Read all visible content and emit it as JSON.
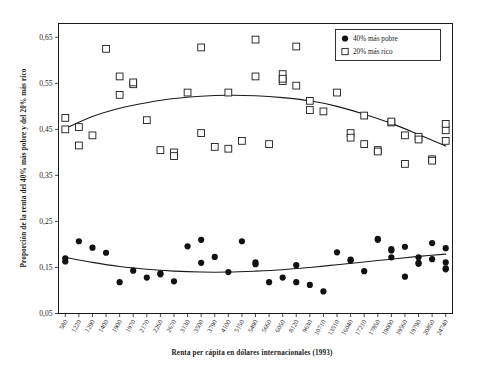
{
  "chart_data": {
    "type": "scatter",
    "title": "",
    "xlabel": "Renta per cápita en dólares internacionales (1993)",
    "ylabel": "Proporción de la renta del 40% más pobre y del 20% más rico",
    "grid": false,
    "legend_position": "top-right",
    "ylim": [
      0.05,
      0.68
    ],
    "yticks": [
      "0,05",
      "0,15",
      "0,25",
      "0,35",
      "0,45",
      "0,55",
      "0,65"
    ],
    "ytick_values": [
      0.05,
      0.15,
      0.25,
      0.35,
      0.45,
      0.55,
      0.65
    ],
    "xtick_labels": [
      "580",
      "1220",
      "1290",
      "1400",
      "1900",
      "1970",
      "2170",
      "2260",
      "2670",
      "3130",
      "3500",
      "3790",
      "4100",
      "5150",
      "5490",
      "5660",
      "6050",
      "8120",
      "9630",
      "10710",
      "13510",
      "16040",
      "17210",
      "17850",
      "19000",
      "19560",
      "19790",
      "20850",
      "24740"
    ],
    "legend": [
      {
        "label": "40% más pobre",
        "marker": "filled-circle",
        "color": "#111111"
      },
      {
        "label": "20% más rico",
        "marker": "open-square",
        "color": "#ffffff"
      }
    ],
    "series": [
      {
        "name": "20% más rico",
        "marker": "open-square",
        "points": [
          [
            0,
            0.45
          ],
          [
            0,
            0.475
          ],
          [
            1,
            0.455
          ],
          [
            1,
            0.415
          ],
          [
            2,
            0.437
          ],
          [
            3,
            0.625
          ],
          [
            4,
            0.525
          ],
          [
            4,
            0.565
          ],
          [
            5,
            0.548
          ],
          [
            5,
            0.552
          ],
          [
            6,
            0.47
          ],
          [
            7,
            0.405
          ],
          [
            8,
            0.4
          ],
          [
            8,
            0.392
          ],
          [
            9,
            0.53
          ],
          [
            10,
            0.442
          ],
          [
            10,
            0.628
          ],
          [
            11,
            0.412
          ],
          [
            12,
            0.408
          ],
          [
            12,
            0.53
          ],
          [
            13,
            0.425
          ],
          [
            14,
            0.565
          ],
          [
            14,
            0.645
          ],
          [
            15,
            0.418
          ],
          [
            16,
            0.555
          ],
          [
            16,
            0.57
          ],
          [
            16,
            0.56
          ],
          [
            17,
            0.545
          ],
          [
            17,
            0.63
          ],
          [
            18,
            0.492
          ],
          [
            18,
            0.512
          ],
          [
            19,
            0.489
          ],
          [
            20,
            0.53
          ],
          [
            21,
            0.442
          ],
          [
            21,
            0.432
          ],
          [
            22,
            0.48
          ],
          [
            22,
            0.418
          ],
          [
            23,
            0.405
          ],
          [
            23,
            0.402
          ],
          [
            24,
            0.465
          ],
          [
            24,
            0.467
          ],
          [
            25,
            0.437
          ],
          [
            25,
            0.375
          ],
          [
            26,
            0.434
          ],
          [
            26,
            0.428
          ],
          [
            27,
            0.385
          ],
          [
            27,
            0.382
          ],
          [
            28,
            0.448
          ],
          [
            28,
            0.425
          ],
          [
            28,
            0.462
          ]
        ]
      },
      {
        "name": "40% más pobre",
        "marker": "filled-circle",
        "points": [
          [
            0,
            0.17
          ],
          [
            0,
            0.163
          ],
          [
            1,
            0.207
          ],
          [
            2,
            0.193
          ],
          [
            3,
            0.182
          ],
          [
            4,
            0.118
          ],
          [
            5,
            0.143
          ],
          [
            6,
            0.128
          ],
          [
            7,
            0.137
          ],
          [
            7,
            0.135
          ],
          [
            8,
            0.12
          ],
          [
            9,
            0.196
          ],
          [
            10,
            0.21
          ],
          [
            10,
            0.16
          ],
          [
            11,
            0.173
          ],
          [
            12,
            0.14
          ],
          [
            13,
            0.207
          ],
          [
            14,
            0.161
          ],
          [
            14,
            0.157
          ],
          [
            15,
            0.118
          ],
          [
            16,
            0.128
          ],
          [
            17,
            0.155
          ],
          [
            17,
            0.118
          ],
          [
            18,
            0.112
          ],
          [
            19,
            0.098
          ],
          [
            20,
            0.183
          ],
          [
            21,
            0.167
          ],
          [
            21,
            0.165
          ],
          [
            22,
            0.142
          ],
          [
            23,
            0.21
          ],
          [
            23,
            0.212
          ],
          [
            24,
            0.172
          ],
          [
            24,
            0.187
          ],
          [
            24,
            0.19
          ],
          [
            25,
            0.195
          ],
          [
            25,
            0.13
          ],
          [
            26,
            0.172
          ],
          [
            26,
            0.16
          ],
          [
            26,
            0.158
          ],
          [
            27,
            0.203
          ],
          [
            27,
            0.168
          ],
          [
            28,
            0.192
          ],
          [
            28,
            0.161
          ],
          [
            28,
            0.148
          ],
          [
            28,
            0.146
          ]
        ]
      }
    ],
    "trend_lines": [
      {
        "name": "20% más rico trend",
        "points": [
          [
            0,
            0.452
          ],
          [
            2,
            0.478
          ],
          [
            4,
            0.496
          ],
          [
            6,
            0.508
          ],
          [
            8,
            0.517
          ],
          [
            10,
            0.522
          ],
          [
            12,
            0.524
          ],
          [
            14,
            0.523
          ],
          [
            16,
            0.519
          ],
          [
            18,
            0.512
          ],
          [
            20,
            0.5
          ],
          [
            22,
            0.483
          ],
          [
            24,
            0.463
          ],
          [
            26,
            0.439
          ],
          [
            28,
            0.414
          ]
        ]
      },
      {
        "name": "40% más pobre trend",
        "points": [
          [
            0,
            0.172
          ],
          [
            2,
            0.161
          ],
          [
            4,
            0.152
          ],
          [
            6,
            0.146
          ],
          [
            8,
            0.142
          ],
          [
            10,
            0.14
          ],
          [
            12,
            0.14
          ],
          [
            14,
            0.142
          ],
          [
            16,
            0.145
          ],
          [
            18,
            0.15
          ],
          [
            20,
            0.156
          ],
          [
            22,
            0.162
          ],
          [
            24,
            0.168
          ],
          [
            26,
            0.174
          ],
          [
            28,
            0.179
          ]
        ]
      }
    ]
  }
}
